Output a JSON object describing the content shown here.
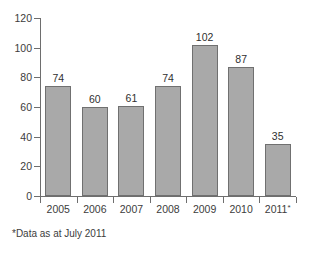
{
  "chart_data": {
    "type": "bar",
    "title": "",
    "subtitle": "",
    "xlabel": "",
    "ylabel": "",
    "categories": [
      "2005",
      "2006",
      "2007",
      "2008",
      "2009",
      "2010",
      "2011*"
    ],
    "values": [
      74,
      60,
      61,
      74,
      102,
      87,
      35
    ],
    "data_labels": [
      "74",
      "60",
      "61",
      "74",
      "102",
      "87",
      "35"
    ],
    "ylim": [
      0,
      120
    ],
    "ytick_values": [
      0,
      20,
      40,
      60,
      80,
      100,
      120
    ],
    "ytick_labels": [
      "0",
      "20",
      "40",
      "60",
      "80",
      "100",
      "120"
    ],
    "grid": false,
    "legend": "none",
    "bar_color": "#a9a9a9",
    "bar_border_color": "#707070",
    "axis_color": "#6e6e6e",
    "background_color": "#ffffff",
    "annotations": [
      {
        "name": "footnote",
        "text": "*Data as at July 2011"
      }
    ]
  },
  "axis": {
    "marker_note": "*"
  },
  "footnote": {
    "text": "*Data as at July 2011"
  }
}
